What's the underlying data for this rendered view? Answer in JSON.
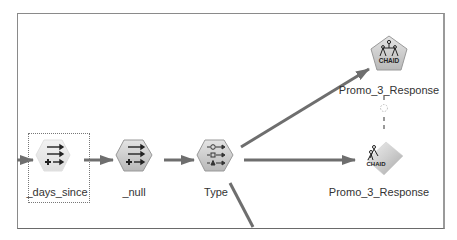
{
  "canvas": {
    "border_color": "#8a8a8a"
  },
  "nodes": [
    {
      "id": "days_since",
      "label": "_days_since",
      "type": "derive",
      "selected": true
    },
    {
      "id": "null",
      "label": "_null",
      "type": "derive"
    },
    {
      "id": "type",
      "label": "Type",
      "type": "type"
    },
    {
      "id": "chaid_model",
      "label": "Promo_3_Response",
      "type": "chaid-modeler"
    },
    {
      "id": "chaid_nugget",
      "label": "Promo_3_Response",
      "type": "chaid-nugget"
    }
  ],
  "links": [
    {
      "from": "input",
      "to": "days_since"
    },
    {
      "from": "days_since",
      "to": "null"
    },
    {
      "from": "null",
      "to": "type"
    },
    {
      "from": "type",
      "to": "chaid_model"
    },
    {
      "from": "type",
      "to": "chaid_nugget"
    },
    {
      "from": "type",
      "to": "offscreen"
    },
    {
      "from": "chaid_model",
      "to": "chaid_nugget",
      "style": "dashed"
    }
  ],
  "icons": {
    "chaid_text": "CHAID"
  },
  "colors": {
    "link": "#6e6e6e",
    "node_fill": "#cfcfcf",
    "node_fill_light": "#ececec"
  }
}
